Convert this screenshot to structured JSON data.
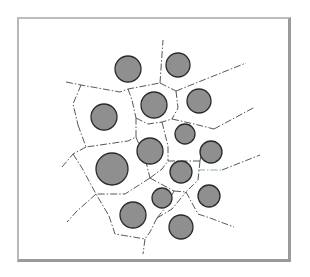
{
  "figure": {
    "type": "voronoi-tessellation",
    "colors": {
      "circle_fill": "#8f8f8f",
      "circle_stroke": "#2a2a2a",
      "boundary": "#444444",
      "accent_boundary": "#6fa9b6",
      "frame": "#9a9a9a"
    },
    "circles": [
      {
        "cx": 128,
        "cy": 69,
        "r": 13
      },
      {
        "cx": 178,
        "cy": 65,
        "r": 12
      },
      {
        "cx": 104,
        "cy": 117,
        "r": 13
      },
      {
        "cx": 154,
        "cy": 105,
        "r": 13
      },
      {
        "cx": 199,
        "cy": 101,
        "r": 12
      },
      {
        "cx": 185,
        "cy": 134,
        "r": 10
      },
      {
        "cx": 150,
        "cy": 151,
        "r": 13
      },
      {
        "cx": 211,
        "cy": 152,
        "r": 11
      },
      {
        "cx": 112,
        "cy": 169,
        "r": 16
      },
      {
        "cx": 181,
        "cy": 172,
        "r": 11
      },
      {
        "cx": 162,
        "cy": 198,
        "r": 10
      },
      {
        "cx": 209,
        "cy": 196,
        "r": 11
      },
      {
        "cx": 133,
        "cy": 215,
        "r": 13
      },
      {
        "cx": 181,
        "cy": 227,
        "r": 12
      }
    ]
  }
}
